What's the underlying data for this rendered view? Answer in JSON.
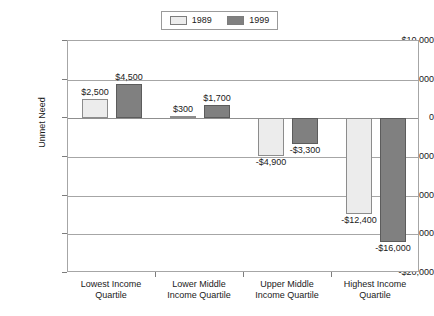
{
  "chart_data": {
    "type": "bar",
    "title": "",
    "xlabel": "",
    "ylabel": "Unmet Need",
    "ylim": [
      -20000,
      10000
    ],
    "ytick_values": [
      10000,
      5000,
      0,
      -5000,
      -10000,
      -15000,
      -20000
    ],
    "ytick_labels": [
      "$10,000",
      "$5,000",
      "0",
      "-$5,000",
      "-$10,000",
      "-$15,000",
      "-$20,000"
    ],
    "grid": true,
    "legend_position": "top-center",
    "categories": [
      "Lowest Income Quartile",
      "Lower Middle Income Quartile",
      "Upper Middle Income Quartile",
      "Highest Income Quartile"
    ],
    "category_lines": [
      [
        "Lowest Income",
        "Quartile"
      ],
      [
        "Lower Middle",
        "Income Quartile"
      ],
      [
        "Upper Middle",
        "Income Quartile"
      ],
      [
        "Highest Income",
        "Quartile"
      ]
    ],
    "series": [
      {
        "name": "1989",
        "color": "#ECECEC",
        "values": [
          2500,
          300,
          -4900,
          -12400
        ],
        "value_labels": [
          "$2,500",
          "$300",
          "-$4,900",
          "-$12,400"
        ]
      },
      {
        "name": "1999",
        "color": "#808080",
        "values": [
          4500,
          1700,
          -3300,
          -16000
        ],
        "value_labels": [
          "$4,500",
          "$1,700",
          "-$3,300",
          "-$16,000"
        ]
      }
    ]
  },
  "legend": {
    "entries": [
      {
        "label": "1989",
        "color": "#ECECEC"
      },
      {
        "label": "1999",
        "color": "#808080"
      }
    ]
  },
  "axis": {
    "y_title": "Unmet Need"
  }
}
